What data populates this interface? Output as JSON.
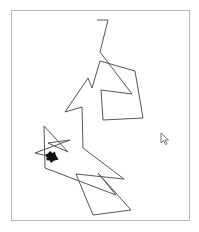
{
  "canvas": {
    "background": "#ffffff",
    "border_color": "#b8b8b8",
    "stroke_color": "#555555",
    "turtle_color": "#111111"
  },
  "turtle_path": [
    [
      97,
      20
    ],
    [
      108,
      20
    ],
    [
      100,
      52
    ],
    [
      132,
      94
    ],
    [
      101,
      90
    ],
    [
      103,
      120
    ],
    [
      143,
      118
    ],
    [
      135,
      71
    ],
    [
      100,
      61
    ],
    [
      92,
      88
    ],
    [
      88,
      78
    ],
    [
      65,
      112
    ],
    [
      82,
      107
    ],
    [
      83,
      148
    ],
    [
      124,
      179
    ],
    [
      76,
      174
    ],
    [
      93,
      215
    ],
    [
      131,
      210
    ],
    [
      98,
      173
    ],
    [
      116,
      195
    ],
    [
      45,
      168
    ],
    [
      44,
      126
    ],
    [
      68,
      152
    ],
    [
      48,
      143
    ],
    [
      70,
      140
    ],
    [
      35,
      153
    ],
    [
      52,
      157
    ]
  ],
  "turtle": {
    "x": 52,
    "y": 157,
    "heading_deg": 200,
    "icon": "turtle-icon"
  },
  "cursor": {
    "x": 161,
    "y": 133,
    "icon": "mouse-pointer-icon"
  }
}
